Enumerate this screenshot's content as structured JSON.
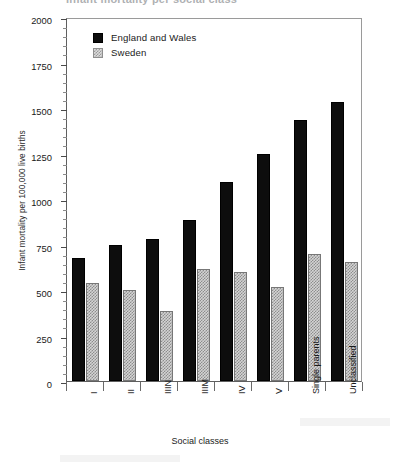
{
  "title_clipped": "Infant mortality per social class",
  "legend": {
    "position": "top-left",
    "entries": [
      {
        "label": "England and Wales",
        "swatch": "solid-black-square-icon",
        "color": "#0d0d0d"
      },
      {
        "label": "Sweden",
        "swatch": "checkered-gray-square-icon",
        "color": "#d4d4d4"
      }
    ]
  },
  "axes": {
    "ylabel": "Infant mortality per 100,000 live births",
    "xlabel": "Social classes",
    "yticks": [
      0,
      250,
      500,
      750,
      1000,
      1250,
      1500,
      1750,
      2000
    ],
    "ytick_labels": [
      "0",
      "250",
      "500",
      "750",
      "1000",
      "1250",
      "1500",
      "1750",
      "2000"
    ],
    "yminor_step": 50
  },
  "chart_data": {
    "type": "bar",
    "title": "Infant mortality per social class",
    "xlabel": "Social classes",
    "ylabel": "Infant mortality per 100,000 live births",
    "ylim": [
      0,
      2000
    ],
    "ytick_step": 250,
    "grid": false,
    "legend_position": "top-left",
    "categories": [
      "I",
      "II",
      "IIIN",
      "IIIM",
      "IV",
      "V",
      "Single parents",
      "Unclassified"
    ],
    "series": [
      {
        "name": "England and Wales",
        "color": "#0d0d0d",
        "values": [
          675,
          745,
          780,
          885,
          1095,
          1250,
          1435,
          1535
        ]
      },
      {
        "name": "Sweden",
        "color": "#d4d4d4",
        "values": [
          540,
          500,
          385,
          615,
          600,
          515,
          700,
          655
        ]
      }
    ]
  }
}
